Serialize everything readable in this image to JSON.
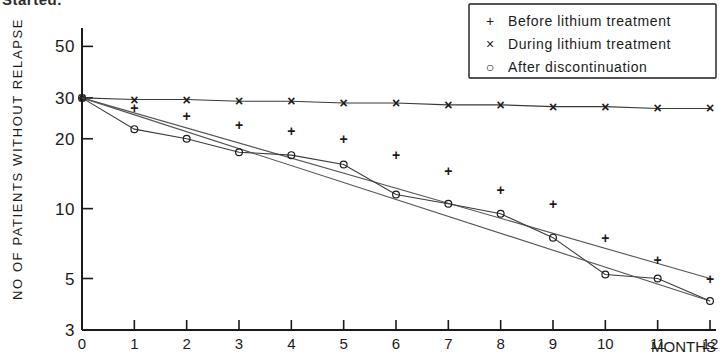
{
  "page": {
    "clipped_heading": "Started."
  },
  "chart_data": {
    "type": "line",
    "title": "",
    "xlabel": "MONTHS",
    "ylabel": "NO OF PATIENTS WITHOUT RELAPSE",
    "x": [
      0,
      1,
      2,
      3,
      4,
      5,
      6,
      7,
      8,
      9,
      10,
      11,
      12
    ],
    "xlim": [
      0,
      12
    ],
    "xticks": [
      "0",
      "1",
      "2",
      "3",
      "4",
      "5",
      "6",
      "7",
      "8",
      "9",
      "10",
      "11",
      "12"
    ],
    "yscale": "log",
    "ylim": [
      3,
      60
    ],
    "yticks": [
      "50",
      "30",
      "20",
      "10",
      "5",
      "3"
    ],
    "ytick_values": [
      50,
      30,
      20,
      10,
      5,
      3
    ],
    "grid": false,
    "legend_position": "top-right",
    "series": [
      {
        "name": "Before lithium treatment",
        "marker": "+",
        "marker_glyph": "+",
        "values": [
          30,
          27,
          25,
          23,
          21.5,
          20,
          17,
          14.5,
          12,
          10.5,
          7.5,
          6,
          5
        ]
      },
      {
        "name": "During lithium treatment",
        "marker": "x",
        "marker_glyph": "×",
        "values": [
          30,
          29.5,
          29.5,
          29,
          29,
          28.5,
          28.5,
          28,
          28,
          27.5,
          27.5,
          27,
          27
        ]
      },
      {
        "name": "After discontinuation",
        "marker": "o",
        "marker_glyph": "○",
        "values": [
          30,
          22,
          20,
          17.5,
          17,
          15.5,
          11.5,
          10.5,
          9.5,
          7.5,
          5.2,
          5,
          4
        ]
      }
    ]
  },
  "legend": {
    "items": [
      {
        "marker": "+",
        "label": "Before lithium treatment"
      },
      {
        "marker": "×",
        "label": "During lithium treatment"
      },
      {
        "marker": "○",
        "label": "After discontinuation"
      }
    ]
  }
}
